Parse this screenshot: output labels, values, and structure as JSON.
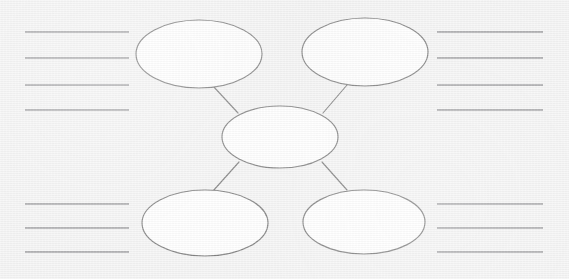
{
  "worksheet": {
    "title": "Blank concept map graphic organizer",
    "width": 569,
    "height": 279,
    "background_color": "#f1f1f1",
    "ink_color": "#4a4a4a",
    "rule_color": "#6e6e72",
    "node_fill": "#ffffff"
  },
  "nodes": [
    {
      "id": "center",
      "label": "",
      "cx": 280,
      "cy": 137,
      "rx": 58,
      "ry": 31
    },
    {
      "id": "top-left",
      "label": "",
      "cx": 199,
      "cy": 54,
      "rx": 63,
      "ry": 34
    },
    {
      "id": "top-right",
      "label": "",
      "cx": 365,
      "cy": 52,
      "rx": 63,
      "ry": 34
    },
    {
      "id": "bottom-left",
      "label": "",
      "cx": 205,
      "cy": 223,
      "rx": 63,
      "ry": 33
    },
    {
      "id": "bottom-right",
      "label": "",
      "cx": 364,
      "cy": 222,
      "rx": 61,
      "ry": 32
    }
  ],
  "connectors": [
    {
      "id": "center-to-top-left",
      "from": "center",
      "to": "top-left",
      "x1": 238,
      "y1": 113,
      "x2": 213,
      "y2": 86
    },
    {
      "id": "center-to-top-right",
      "from": "center",
      "to": "top-right",
      "x1": 323,
      "y1": 113,
      "x2": 347,
      "y2": 85
    },
    {
      "id": "center-to-bottom-left",
      "from": "center",
      "to": "bottom-left",
      "x1": 239,
      "y1": 162,
      "x2": 213,
      "y2": 191
    },
    {
      "id": "center-to-bottom-right",
      "from": "center",
      "to": "bottom-right",
      "x1": 322,
      "y1": 162,
      "x2": 347,
      "y2": 190
    }
  ],
  "rule_groups": [
    {
      "id": "top-left-rules",
      "position": "top-left",
      "line_count": 4,
      "x_start": 25,
      "x_end": 129,
      "y_values": [
        32,
        58,
        85,
        110
      ],
      "lines": [
        "",
        "",
        "",
        ""
      ]
    },
    {
      "id": "top-right-rules",
      "position": "top-right",
      "line_count": 4,
      "x_start": 437,
      "x_end": 543,
      "y_values": [
        32,
        58,
        85,
        110
      ],
      "lines": [
        "",
        "",
        "",
        ""
      ]
    },
    {
      "id": "bottom-left-rules",
      "position": "bottom-left",
      "line_count": 3,
      "x_start": 25,
      "x_end": 129,
      "y_values": [
        204,
        228,
        252
      ],
      "lines": [
        "",
        "",
        ""
      ]
    },
    {
      "id": "bottom-right-rules",
      "position": "bottom-right",
      "line_count": 3,
      "x_start": 437,
      "x_end": 543,
      "y_values": [
        204,
        228,
        252
      ],
      "lines": [
        "",
        "",
        ""
      ]
    }
  ]
}
